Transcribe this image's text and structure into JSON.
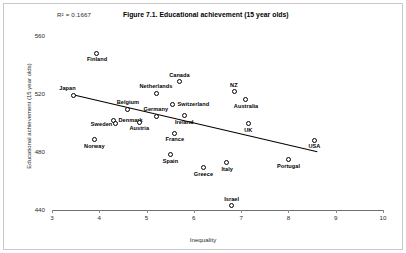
{
  "figure": {
    "title": "Figure 7.1. Educational achievement (15 year olds)",
    "r2_text": "R² = 0.1667"
  },
  "chart_data": {
    "type": "scatter",
    "title": "Figure 7.1. Educational achievement (15 year olds)",
    "xlabel": "Inequality",
    "ylabel": "Educational achievement (15 year olds)",
    "xlim": [
      3,
      10
    ],
    "ylim": [
      440,
      560
    ],
    "xticks": [
      3,
      4,
      5,
      6,
      7,
      8,
      9,
      10
    ],
    "yticks": [
      440,
      480,
      520,
      560
    ],
    "grid": false,
    "legend": false,
    "r2": 0.1667,
    "annotation": "R² = 0.1667",
    "trendline": {
      "x_start": 3.42,
      "y_start": 520.0,
      "x_end": 8.62,
      "y_end": 480.5
    },
    "points": [
      {
        "label": "Finland",
        "x": 3.95,
        "y": 548.0,
        "label_pos": "below"
      },
      {
        "label": "Japan",
        "x": 3.45,
        "y": 519.0,
        "label_pos": "above-left"
      },
      {
        "label": "Canada",
        "x": 5.7,
        "y": 528.5,
        "label_pos": "above"
      },
      {
        "label": "Netherlands",
        "x": 5.2,
        "y": 520.5,
        "label_pos": "above"
      },
      {
        "label": "NZ",
        "x": 6.85,
        "y": 521.5,
        "label_pos": "above"
      },
      {
        "label": "Australia",
        "x": 7.1,
        "y": 516.0,
        "label_pos": "below"
      },
      {
        "label": "Switzerland",
        "x": 5.55,
        "y": 513.0,
        "label_pos": "above-right"
      },
      {
        "label": "Belgium",
        "x": 4.6,
        "y": 509.5,
        "label_pos": "above"
      },
      {
        "label": "Germany",
        "x": 5.2,
        "y": 504.5,
        "label_pos": "above"
      },
      {
        "label": "Ireland",
        "x": 5.8,
        "y": 505.0,
        "label_pos": "below"
      },
      {
        "label": "Denmark",
        "x": 4.3,
        "y": 502.0,
        "label_pos": "right"
      },
      {
        "label": "Austria",
        "x": 4.85,
        "y": 500.5,
        "label_pos": "below"
      },
      {
        "label": "Sweden",
        "x": 4.35,
        "y": 499.5,
        "label_pos": "left"
      },
      {
        "label": "UK",
        "x": 7.15,
        "y": 499.5,
        "label_pos": "below"
      },
      {
        "label": "France",
        "x": 5.6,
        "y": 493.0,
        "label_pos": "below"
      },
      {
        "label": "USA",
        "x": 8.55,
        "y": 488.0,
        "label_pos": "below"
      },
      {
        "label": "Norway",
        "x": 3.9,
        "y": 488.5,
        "label_pos": "below"
      },
      {
        "label": "Spain",
        "x": 5.5,
        "y": 478.0,
        "label_pos": "below"
      },
      {
        "label": "Portugal",
        "x": 8.0,
        "y": 474.5,
        "label_pos": "below"
      },
      {
        "label": "Italy",
        "x": 6.7,
        "y": 472.5,
        "label_pos": "below"
      },
      {
        "label": "Greece",
        "x": 6.2,
        "y": 469.0,
        "label_pos": "below"
      },
      {
        "label": "Israel",
        "x": 6.8,
        "y": 443.0,
        "label_pos": "above"
      }
    ]
  }
}
